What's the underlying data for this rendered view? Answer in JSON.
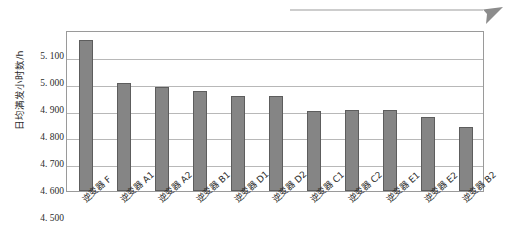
{
  "chart_data": {
    "type": "bar",
    "title": "",
    "subtitle": "",
    "xlabel": "",
    "ylabel": "日均满发小时数/h",
    "ylim": [
      4.5,
      5.1
    ],
    "ytick_step": 0.1,
    "ytick_labels": [
      "5. 100",
      "5. 000",
      "4. 900",
      "4. 800",
      "4. 700",
      "4. 600",
      "4. 500"
    ],
    "ytick_values": [
      5.1,
      5.0,
      4.9,
      4.8,
      4.7,
      4.6,
      4.5
    ],
    "grid": "horizontal",
    "legend": "none",
    "categories": [
      "逆变器 F",
      "逆变器 A1",
      "逆变器 A2",
      "逆变器 B1",
      "逆变器 D1",
      "逆变器 D2",
      "逆变器 C1",
      "逆变器 C2",
      "逆变器 E1",
      "逆变器 E2",
      "逆变器 B2"
    ],
    "values": [
      5.062,
      4.904,
      4.889,
      4.871,
      4.855,
      4.855,
      4.8,
      4.801,
      4.801,
      4.777,
      4.737
    ],
    "bar_fill_color": "#858585",
    "bar_edge_color": "#5d5d5d",
    "gridline_color": "#b8b8b8",
    "axis_color": "#9a9a9a"
  },
  "decoration": {
    "top_rule_name": "arrow-rule",
    "top_rule_color": "#8c8c8c"
  }
}
